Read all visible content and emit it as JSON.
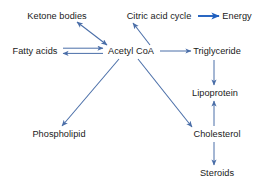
{
  "diagram": {
    "canvas": {
      "width": 267,
      "height": 187
    },
    "colors": {
      "edge": "#4a6ea8",
      "edge_bold": "#1f5fbf",
      "text": "#1a1a1a",
      "background": "#ffffff"
    },
    "nodes": [
      {
        "id": "ketone_bodies",
        "label": "Ketone bodies",
        "x": 57,
        "y": 16
      },
      {
        "id": "citric_acid_cycle",
        "label": "Citric acid cycle",
        "x": 159,
        "y": 16
      },
      {
        "id": "energy",
        "label": "Energy",
        "x": 237,
        "y": 16
      },
      {
        "id": "fatty_acids",
        "label": "Fatty acids",
        "x": 35,
        "y": 51
      },
      {
        "id": "acetyl_coa",
        "label": "Acetyl CoA",
        "x": 131,
        "y": 51
      },
      {
        "id": "triglyceride",
        "label": "Triglyceride",
        "x": 217,
        "y": 51
      },
      {
        "id": "lipoprotein",
        "label": "Lipoprotein",
        "x": 215,
        "y": 93
      },
      {
        "id": "phospholipid",
        "label": "Phospholipid",
        "x": 59,
        "y": 134
      },
      {
        "id": "cholesterol",
        "label": "Cholesterol",
        "x": 217,
        "y": 134
      },
      {
        "id": "steroids",
        "label": "Steroids",
        "x": 217,
        "y": 173
      }
    ],
    "edges": [
      {
        "id": "ketone-acetyl",
        "from": "acetyl_coa",
        "to": "ketone_bodies",
        "kind": "double-headed",
        "label": ""
      },
      {
        "id": "acetyl-citric",
        "from": "acetyl_coa",
        "to": "citric_acid_cycle",
        "kind": "single",
        "label": ""
      },
      {
        "id": "citric-energy",
        "from": "citric_acid_cycle",
        "to": "energy",
        "kind": "bold",
        "label": ""
      },
      {
        "id": "fatty-acetyl",
        "from": "fatty_acids",
        "to": "acetyl_coa",
        "kind": "reversible",
        "label": ""
      },
      {
        "id": "acetyl-triglyceride",
        "from": "acetyl_coa",
        "to": "triglyceride",
        "kind": "single",
        "label": ""
      },
      {
        "id": "acetyl-phospholipid",
        "from": "acetyl_coa",
        "to": "phospholipid",
        "kind": "single",
        "label": ""
      },
      {
        "id": "acetyl-cholesterol",
        "from": "acetyl_coa",
        "to": "cholesterol",
        "kind": "single",
        "label": ""
      },
      {
        "id": "triglyceride-lipo",
        "from": "triglyceride",
        "to": "lipoprotein",
        "kind": "single",
        "label": ""
      },
      {
        "id": "cholesterol-lipo",
        "from": "cholesterol",
        "to": "lipoprotein",
        "kind": "single",
        "label": ""
      },
      {
        "id": "cholesterol-steroids",
        "from": "cholesterol",
        "to": "steroids",
        "kind": "single",
        "label": ""
      }
    ]
  }
}
